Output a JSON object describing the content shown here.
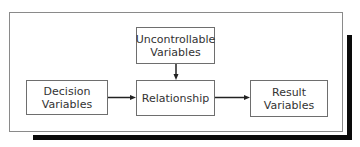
{
  "diagram": {
    "type": "flow",
    "nodes": {
      "decision": {
        "line1": "Decision",
        "line2": "Variables"
      },
      "uncontrollable": {
        "line1": "Uncontrollable",
        "line2": "Variables"
      },
      "relationship": {
        "line1": "Relationship"
      },
      "result": {
        "line1": "Result",
        "line2": "Variables"
      }
    },
    "edges": [
      {
        "from": "Decision Variables",
        "to": "Relationship"
      },
      {
        "from": "Uncontrollable Variables",
        "to": "Relationship"
      },
      {
        "from": "Relationship",
        "to": "Result Variables"
      }
    ],
    "colors": {
      "border": "#6e6e6e",
      "text": "#333333",
      "shadow": "#0a0a0a"
    }
  }
}
